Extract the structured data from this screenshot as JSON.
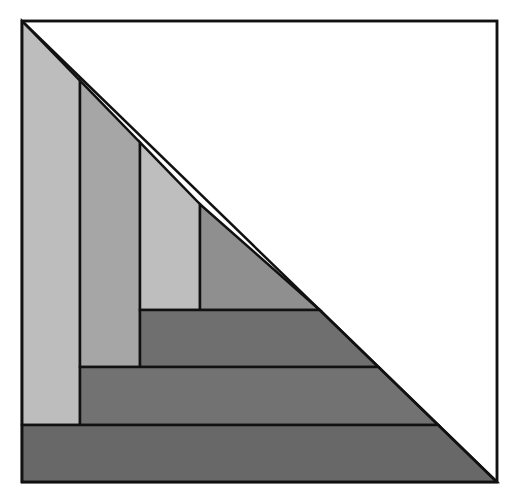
{
  "title_clipped": "",
  "diagram": {
    "outer_square": {
      "x1": 22,
      "y1": 21,
      "x2": 497,
      "y2": 482,
      "stroke": "#111111",
      "fill": "#ffffff"
    },
    "diagonal": {
      "from": [
        22,
        21
      ],
      "to": [
        497,
        482
      ]
    },
    "regions": [
      {
        "name": "vertical-strip-1",
        "points": "22,21 80,80.7 80,425 22,425",
        "fill": "#bdbdbd"
      },
      {
        "name": "vertical-strip-2",
        "points": "80,80.7 140,142.4 140,367 80,367",
        "fill": "#a6a6a6"
      },
      {
        "name": "vertical-strip-3",
        "points": "140,142.4 200,204.2 200,310 140,310",
        "fill": "#bebebe"
      },
      {
        "name": "corner-triangle",
        "points": "200,204.2 319.8,310 200,310",
        "fill": "#8f8f8f"
      },
      {
        "name": "horizontal-bar-1",
        "points": "140,310 319.8,310 378.5,367 140,367",
        "fill": "#6f6f6f"
      },
      {
        "name": "horizontal-bar-2",
        "points": "80,367 378.5,367 438.3,425 80,425",
        "fill": "#727272"
      },
      {
        "name": "horizontal-bar-3",
        "points": "22,425 438.3,425 497,482 22,482",
        "fill": "#686868"
      }
    ],
    "stroke_color": "#111111"
  }
}
